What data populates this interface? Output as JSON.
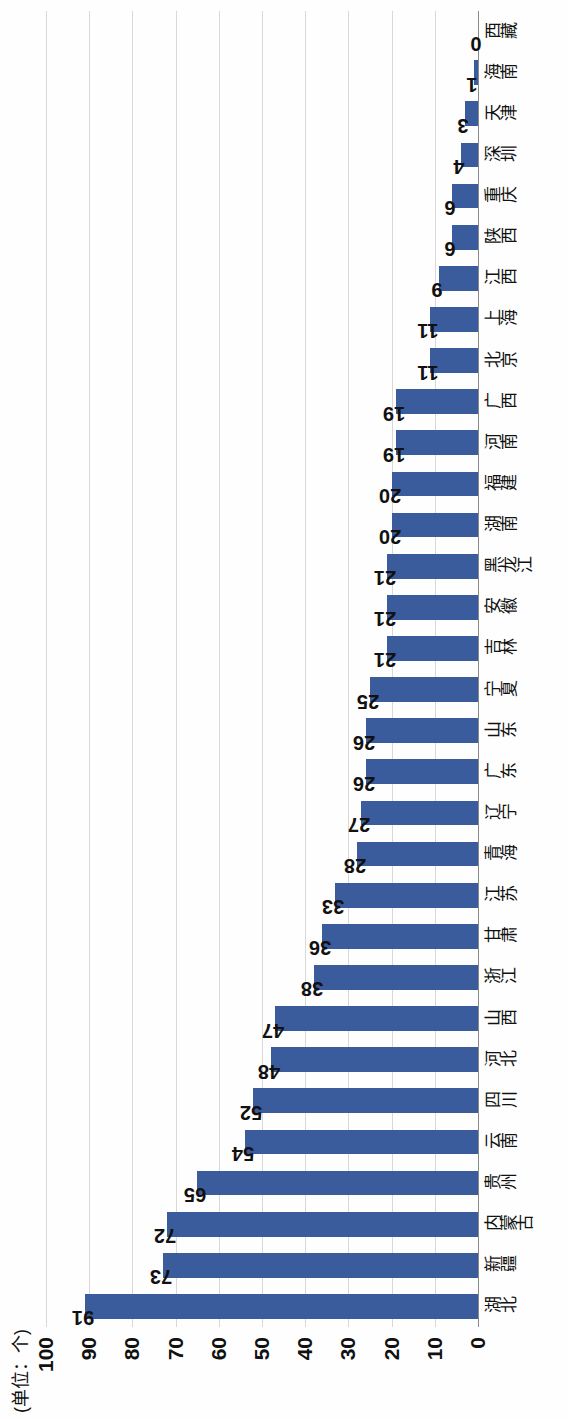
{
  "chart_data": {
    "type": "bar",
    "title": "",
    "subtitle": "",
    "unit_label": "(单位：个)",
    "xlabel": "",
    "ylabel": "",
    "ylim": [
      0,
      100
    ],
    "ytick_labels": [
      "100",
      "90",
      "80",
      "70",
      "60",
      "50",
      "40",
      "30",
      "20",
      "10",
      "0"
    ],
    "yticks": [
      100,
      90,
      80,
      70,
      60,
      50,
      40,
      30,
      20,
      10,
      0
    ],
    "grid": true,
    "legend": "none",
    "orientation": "vertical-bars-rotated-90",
    "bar_color": "#3b5c9c",
    "categories": [
      "湖北",
      "新疆",
      "内蒙古",
      "贵州",
      "云南",
      "四川",
      "河北",
      "山西",
      "浙江",
      "甘肃",
      "江苏",
      "青海",
      "辽宁",
      "广东",
      "山东",
      "宁夏",
      "吉林",
      "安徽",
      "黑龙江",
      "湖南",
      "福建",
      "河南",
      "广西",
      "北京",
      "上海",
      "江西",
      "陕西",
      "重庆",
      "深圳",
      "天津",
      "海南",
      "西藏"
    ],
    "values": [
      91,
      73,
      72,
      65,
      54,
      52,
      48,
      47,
      38,
      36,
      33,
      28,
      27,
      26,
      26,
      25,
      21,
      21,
      21,
      20,
      20,
      19,
      19,
      11,
      11,
      9,
      6,
      6,
      4,
      3,
      1,
      0
    ],
    "value_labels": [
      "91",
      "73",
      "72",
      "65",
      "54",
      "52",
      "48",
      "47",
      "38",
      "36",
      "33",
      "28",
      "27",
      "26",
      "26",
      "25",
      "21",
      "21",
      "21",
      "20",
      "20",
      "19",
      "19",
      "11",
      "11",
      "9",
      "6",
      "6",
      "4",
      "3",
      "1",
      "0"
    ]
  }
}
